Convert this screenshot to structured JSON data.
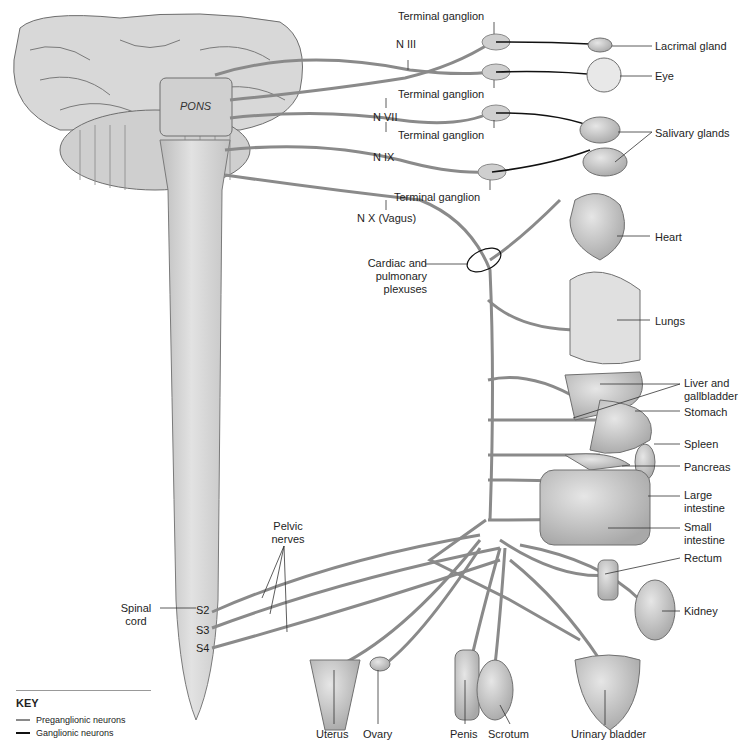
{
  "diagram": {
    "structures": {
      "pons": "PONS",
      "spinal_cord": "Spinal cord",
      "segments": [
        "S2",
        "S3",
        "S4"
      ]
    },
    "nerves": {
      "n3": "N III",
      "n7": "N VII",
      "n9": "N IX",
      "n10": "N X (Vagus)",
      "pelvic": "Pelvic nerves",
      "plexus": "Cardiac and pulmonary plexuses"
    },
    "ganglia": {
      "g1": "Terminal ganglion",
      "g2": "Terminal ganglion",
      "g3": "Terminal ganglion",
      "g4": "Terminal ganglion"
    },
    "organs": {
      "lacrimal": "Lacrimal gland",
      "eye": "Eye",
      "salivary": "Salivary glands",
      "heart": "Heart",
      "lungs": "Lungs",
      "liver": "Liver and gallbladder",
      "stomach": "Stomach",
      "spleen": "Spleen",
      "pancreas": "Pancreas",
      "large_intestine": "Large intestine",
      "small_intestine": "Small intestine",
      "rectum": "Rectum",
      "kidney": "Kidney",
      "bladder": "Urinary bladder",
      "uterus": "Uterus",
      "ovary": "Ovary",
      "penis": "Penis",
      "scrotum": "Scrotum"
    },
    "key": {
      "title": "KEY",
      "items": [
        {
          "label": "Preganglionic neurons",
          "color": "#8a8a8a"
        },
        {
          "label": "Ganglionic neurons",
          "color": "#111111"
        }
      ]
    },
    "colors": {
      "tissue": "#d9d9d9",
      "tissue_dark": "#a9a9a9",
      "outline": "#6e6e6e",
      "preganglionic": "#8a8a8a",
      "ganglionic": "#111111"
    }
  }
}
